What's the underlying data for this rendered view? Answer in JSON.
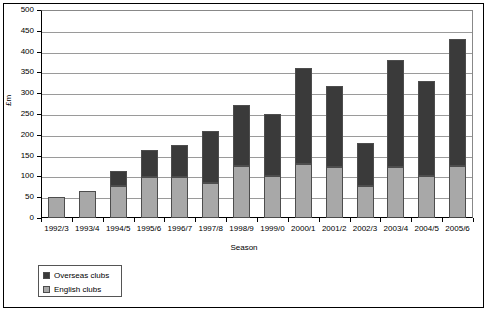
{
  "chart_data": {
    "type": "bar",
    "subtype": "stacked-bar",
    "title": "",
    "xlabel": "Season",
    "ylabel": "£m",
    "ylim": [
      0,
      500
    ],
    "ytick_step": 50,
    "grid": true,
    "legend_position": "below-left",
    "categories": [
      "1992/3",
      "1993/4",
      "1994/5",
      "1995/6",
      "1996/7",
      "1997/8",
      "1998/9",
      "1999/0",
      "2000/1",
      "2001/2",
      "2002/3",
      "2003/4",
      "2004/5",
      "2005/6"
    ],
    "yticks": [
      "0",
      "50",
      "100",
      "150",
      "200",
      "250",
      "300",
      "350",
      "400",
      "450",
      "500"
    ],
    "series": [
      {
        "name": "English clubs",
        "color": "#a8a8a8",
        "values": [
          50,
          65,
          78,
          98,
          98,
          85,
          125,
          100,
          130,
          123,
          78,
          123,
          100,
          125
        ]
      },
      {
        "name": "Overseas clubs",
        "color": "#3a3a3a",
        "values": [
          0,
          0,
          35,
          65,
          78,
          125,
          147,
          150,
          230,
          195,
          102,
          257,
          230,
          305
        ]
      }
    ],
    "totals": [
      50,
      65,
      113,
      163,
      176,
      210,
      272,
      250,
      360,
      318,
      180,
      380,
      330,
      430
    ],
    "legend": [
      {
        "label": "Overseas clubs",
        "color": "#3a3a3a"
      },
      {
        "label": "English clubs",
        "color": "#a8a8a8"
      }
    ]
  }
}
